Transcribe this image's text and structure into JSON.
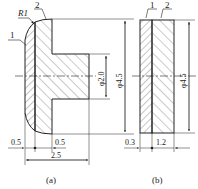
{
  "figure_a": {
    "caption": "(a)",
    "labels": {
      "part1": "1",
      "part2": "2",
      "radius": "R1"
    },
    "dimensions": {
      "hub_diameter": "φ2.0",
      "outer_diameter": "φ4.5",
      "left_offset": "0.5",
      "right_offset": "0.5",
      "total_length": "2.5"
    }
  },
  "figure_b": {
    "caption": "(b)",
    "labels": {
      "part1": "1",
      "part2": "2"
    },
    "dimensions": {
      "outer_diameter": "φ4.5",
      "layer1_thickness": "0.3",
      "layer2_thickness": "1.2"
    }
  },
  "colors": {
    "line": "#222222",
    "hatch": "#555555"
  }
}
